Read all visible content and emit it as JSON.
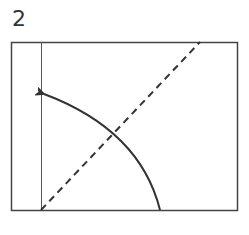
{
  "step_number": "2",
  "diagram": {
    "type": "origami-fold-step",
    "elements": [
      "paper-rectangle",
      "crease-line",
      "dashed-fold-line",
      "fold-arrow"
    ],
    "colors": {
      "line": "#333333",
      "background": "#ffffff"
    }
  }
}
